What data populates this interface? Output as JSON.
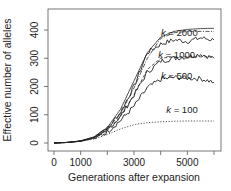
{
  "chart_data": {
    "type": "line",
    "title": "",
    "xlabel": "Generations after expansion",
    "ylabel": "Effective number of alleles",
    "xlim": [
      0,
      6000
    ],
    "ylim": [
      0,
      420
    ],
    "xticks": [
      0,
      1000,
      2000,
      3000,
      4000,
      5000,
      6000
    ],
    "xtick_labels": [
      "0",
      "1000",
      "",
      "3000",
      "",
      "5000",
      ""
    ],
    "yticks": [
      0,
      100,
      200,
      300,
      400
    ],
    "ytick_labels": [
      "0",
      "100",
      "200",
      "300",
      "400"
    ],
    "grid": false,
    "legend": "none (inline annotations)",
    "x": [
      0,
      500,
      1000,
      1500,
      2000,
      2500,
      3000,
      3500,
      4000,
      4500,
      5000,
      5500,
      6000
    ],
    "series": [
      {
        "name": "theory (deterministic)",
        "style": "solid",
        "values": [
          0,
          2,
          8,
          22,
          55,
          120,
          220,
          320,
          375,
          395,
          402,
          405,
          406
        ]
      },
      {
        "name": "k = 2000",
        "style": "noisy-solid",
        "values": [
          0,
          2,
          7,
          20,
          50,
          110,
          200,
          320,
          350,
          365,
          360,
          372,
          365
        ]
      },
      {
        "name": "k = 2000 (expected)",
        "style": "dash-dot",
        "values": [
          0,
          2,
          7,
          20,
          50,
          105,
          195,
          300,
          370,
          390,
          395,
          395,
          395
        ]
      },
      {
        "name": "k = 1000",
        "style": "noisy-solid",
        "values": [
          0,
          2,
          7,
          19,
          45,
          95,
          170,
          250,
          290,
          300,
          305,
          315,
          300
        ]
      },
      {
        "name": "k = 1000 (expected)",
        "style": "dashed",
        "values": [
          0,
          2,
          7,
          19,
          45,
          95,
          170,
          260,
          300,
          305,
          305,
          305,
          305
        ]
      },
      {
        "name": "k = 500",
        "style": "noisy-solid",
        "values": [
          0,
          2,
          6,
          17,
          40,
          80,
          130,
          195,
          225,
          232,
          230,
          228,
          215
        ]
      },
      {
        "name": "k = 100",
        "style": "dotted",
        "values": [
          0,
          2,
          6,
          14,
          30,
          50,
          65,
          72,
          75,
          77,
          78,
          78,
          78
        ]
      }
    ],
    "annotations": [
      {
        "text": "k = 2000",
        "x": 4700,
        "y": 380
      },
      {
        "text": "k = 1000",
        "x": 4600,
        "y": 300
      },
      {
        "text": "k = 500",
        "x": 4600,
        "y": 225
      },
      {
        "text": "k = 100",
        "x": 4800,
        "y": 105
      }
    ]
  }
}
